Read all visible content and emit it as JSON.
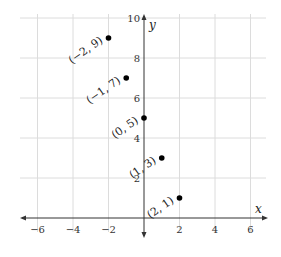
{
  "chart_data": {
    "type": "scatter",
    "title": "",
    "xlabel": "x",
    "ylabel": "y",
    "xlim": [
      -7,
      7
    ],
    "ylim": [
      -1,
      10
    ],
    "grid": true,
    "legend": null,
    "x_ticks": [
      -6,
      -4,
      -2,
      2,
      4,
      6
    ],
    "x_tick_labels": [
      "−6",
      "−4",
      "−2",
      "2",
      "4",
      "6"
    ],
    "y_ticks": [
      2,
      4,
      6,
      8,
      10
    ],
    "y_tick_labels": [
      "2",
      "4",
      "6",
      "8",
      "10"
    ],
    "series": [
      {
        "name": "points",
        "points": [
          {
            "x": -2,
            "y": 9,
            "label": "(−2, 9)"
          },
          {
            "x": -1,
            "y": 7,
            "label": "(−1, 7)"
          },
          {
            "x": 0,
            "y": 5,
            "label": "(0, 5)"
          },
          {
            "x": 1,
            "y": 3,
            "label": "(1, 3)"
          },
          {
            "x": 2,
            "y": 1,
            "label": "(2, 1)"
          }
        ]
      }
    ],
    "annotations": [
      "(−2, 9)",
      "(−1, 7)",
      "(0, 5)",
      "(1, 3)",
      "(2, 1)"
    ]
  },
  "colors": {
    "grid": "#dcdcdc",
    "axis": "#333333",
    "point": "#000000"
  }
}
